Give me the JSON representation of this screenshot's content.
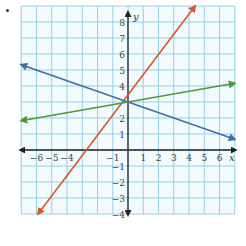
{
  "chart_data": {
    "type": "line",
    "title": "",
    "xlabel": "x",
    "ylabel": "y",
    "xlim": [
      -7,
      7
    ],
    "ylim": [
      -4,
      9
    ],
    "grid": true,
    "x_ticks": [
      "−6",
      "−5",
      "−4",
      "−1",
      "1",
      "2",
      "3",
      "4",
      "5",
      "6"
    ],
    "x_tick_values": [
      -6,
      -5,
      -4,
      -1,
      1,
      2,
      3,
      4,
      5,
      6
    ],
    "y_ticks": [
      "8",
      "7",
      "6",
      "5",
      "4",
      "2",
      "1",
      "−1",
      "−2",
      "−3",
      "−4"
    ],
    "y_tick_values": [
      8,
      7,
      6,
      5,
      4,
      2,
      1,
      -1,
      -2,
      -3,
      -4
    ],
    "series": [
      {
        "name": "red line",
        "color": "#d9582b",
        "equation": "y = 1.5x + 3",
        "slope": 1.5,
        "intercept": 3,
        "points": [
          [
            -5.9,
            -4
          ],
          [
            4.4,
            9
          ]
        ]
      },
      {
        "name": "blue line",
        "color": "#3f6fa8",
        "equation": "y = -x/3 + 3",
        "slope": -0.333,
        "intercept": 3,
        "points": [
          [
            -7,
            5.33
          ],
          [
            7,
            0.67
          ]
        ]
      },
      {
        "name": "green line",
        "color": "#4e9a3a",
        "equation": "y = x/6 + 3",
        "slope": 0.167,
        "intercept": 3,
        "points": [
          [
            -7,
            1.83
          ],
          [
            7,
            4.17
          ]
        ]
      }
    ],
    "intersection": [
      0,
      3
    ]
  },
  "colors": {
    "grid": "#8ccbe0",
    "grid_bg": "#f2fafd",
    "axis": "#222222"
  }
}
